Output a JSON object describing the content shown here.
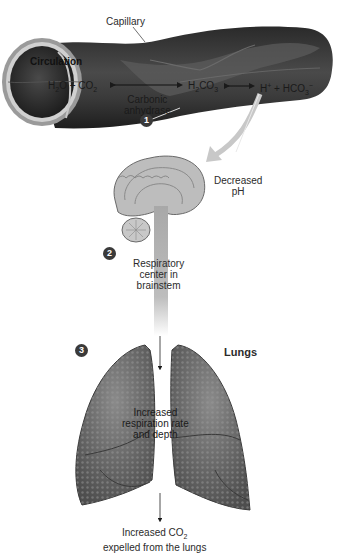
{
  "figure": {
    "capillary": {
      "label": "Capillary",
      "circulation_label": "Circulation",
      "equation": {
        "reactants": "H2O + CO2",
        "reactants_html": [
          "H",
          "2",
          "O + CO",
          "2"
        ],
        "enzyme_line1": "Carbonic",
        "enzyme_line2": "anhydrase",
        "intermediate": "H2CO3",
        "intermediate_parts": [
          "H",
          "2",
          "CO",
          "3"
        ],
        "products": "H+ + HCO3-",
        "products_parts": [
          "H",
          "+",
          " + HCO",
          "3",
          "−"
        ]
      },
      "step": "1"
    },
    "brain": {
      "signal_label_line1": "Decreased",
      "signal_label_line2": "pH",
      "step": "2",
      "center_line1": "Respiratory",
      "center_line2": "center in",
      "center_line3": "brainstem"
    },
    "lungs": {
      "title": "Lungs",
      "step": "3",
      "effect_line1": "Increased",
      "effect_line2": "respiration rate",
      "effect_line3": "and depth",
      "outcome_line1_main": "Increased CO",
      "outcome_line1_sub": "2",
      "outcome_line2": "expelled from the lungs"
    },
    "colors": {
      "vessel_dark": "#2e2e2e",
      "vessel_mid": "#5a5a5a",
      "vessel_light": "#8a8a8a",
      "brain": "#b8b8b8",
      "lungs": "#6a6a6a",
      "badge": "#3a3a3a",
      "arrow": "#c8c8c8"
    }
  }
}
